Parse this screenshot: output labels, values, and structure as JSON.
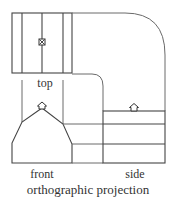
{
  "diagram": {
    "title": "orthographic projection",
    "views": {
      "top": {
        "label": "top"
      },
      "front": {
        "label": "front"
      },
      "side": {
        "label": "side"
      }
    },
    "symbols": {
      "top_vent": "vent-square-x-icon",
      "front_vent": "vent-cupola-icon",
      "side_vent": "vent-cupola-icon"
    },
    "colors": {
      "line": "#444444",
      "text": "#333333",
      "background": "#ffffff"
    }
  }
}
